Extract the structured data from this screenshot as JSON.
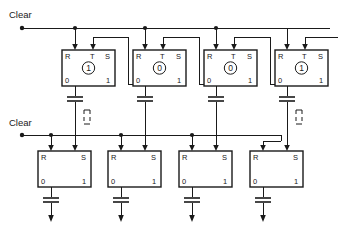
{
  "diagram": {
    "labels": {
      "clear_top": "Clear",
      "clear_bottom": "Clear"
    },
    "pin_names": {
      "reset": "R",
      "trigger": "T",
      "set": "S",
      "out_zero": "0",
      "out_one": "1"
    },
    "top_row": {
      "count": 4,
      "cells": [
        {
          "state": "1",
          "reset_pin": "R",
          "trigger_pin": "T",
          "set_pin": "S",
          "zero_pin": "0",
          "one_pin": "1"
        },
        {
          "state": "0",
          "reset_pin": "R",
          "trigger_pin": "T",
          "set_pin": "S",
          "zero_pin": "0",
          "one_pin": "1"
        },
        {
          "state": "0",
          "reset_pin": "R",
          "trigger_pin": "T",
          "set_pin": "S",
          "zero_pin": "0",
          "one_pin": "1"
        },
        {
          "state": "1",
          "reset_pin": "R",
          "trigger_pin": "T",
          "set_pin": "S",
          "zero_pin": "0",
          "one_pin": "1"
        }
      ]
    },
    "bottom_row": {
      "count": 4,
      "cells": [
        {
          "state": "",
          "reset_pin": "R",
          "set_pin": "S",
          "zero_pin": "0",
          "one_pin": "1"
        },
        {
          "state": "",
          "reset_pin": "R",
          "set_pin": "S",
          "zero_pin": "0",
          "one_pin": "1"
        },
        {
          "state": "",
          "reset_pin": "R",
          "set_pin": "S",
          "zero_pin": "0",
          "one_pin": "1"
        },
        {
          "state": "",
          "reset_pin": "R",
          "set_pin": "S",
          "zero_pin": "0",
          "one_pin": "1"
        }
      ]
    },
    "colors": {
      "ink": "#1a1a1a",
      "background": "#ffffff"
    },
    "symbols": {
      "capacitor": "capacitor-symbol",
      "junction": "junction-dot",
      "terminal": "terminal-dot",
      "arrow": "signal-arrow",
      "dashed": "dashed-connector"
    }
  }
}
